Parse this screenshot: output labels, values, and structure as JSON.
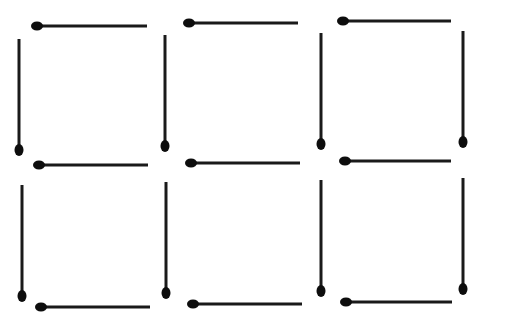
{
  "diagram": {
    "title": "",
    "colors": {
      "stick": "#1a1a1a",
      "head": "#0d0d0d",
      "background": "#ffffff"
    },
    "horizontal_matches": [
      {
        "x1": 37,
        "x2": 147,
        "y": 26
      },
      {
        "x1": 189,
        "x2": 298,
        "y": 23
      },
      {
        "x1": 343,
        "x2": 451,
        "y": 21
      },
      {
        "x1": 39,
        "x2": 148,
        "y": 165
      },
      {
        "x1": 191,
        "x2": 300,
        "y": 163
      },
      {
        "x1": 345,
        "x2": 451,
        "y": 161
      },
      {
        "x1": 41,
        "x2": 150,
        "y": 307
      },
      {
        "x1": 193,
        "x2": 302,
        "y": 304
      },
      {
        "x1": 346,
        "x2": 452,
        "y": 302
      }
    ],
    "vertical_matches": [
      {
        "x": 19,
        "y1": 39,
        "y2": 150
      },
      {
        "x": 165,
        "y1": 35,
        "y2": 146
      },
      {
        "x": 321,
        "y1": 33,
        "y2": 144
      },
      {
        "x": 463,
        "y1": 31,
        "y2": 142
      },
      {
        "x": 22,
        "y1": 185,
        "y2": 296
      },
      {
        "x": 166,
        "y1": 182,
        "y2": 293
      },
      {
        "x": 321,
        "y1": 180,
        "y2": 291
      },
      {
        "x": 463,
        "y1": 178,
        "y2": 289
      }
    ]
  }
}
